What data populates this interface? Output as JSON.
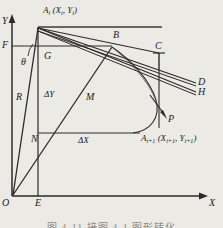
{
  "figure": {
    "type": "geometry-diagram",
    "background_color": "#eceae5",
    "ink_color": "#1a1a1a",
    "axes": {
      "y_label": "Y",
      "x_label": "X",
      "origin_label": "O"
    },
    "points": {
      "A_i": "A",
      "A_i_sub": "i",
      "A_i_coords_open": " (X",
      "A_i_coords_sub1": "i",
      "A_i_coords_mid": ", Y",
      "A_i_coords_sub2": "i",
      "A_i_coords_close": ")",
      "A_next": "A",
      "A_next_sub": "i+1",
      "A_next_coords_open": " (X",
      "A_next_coords_sub1": "i+1",
      "A_next_coords_mid": ", Y",
      "A_next_coords_sub2": "i+1",
      "A_next_coords_close": ")",
      "B": "B",
      "C": "C",
      "D": "D",
      "H": "H",
      "P": "P",
      "E": "E",
      "F": "F",
      "G": "G",
      "N": "N",
      "M": "M",
      "R": "R",
      "theta": "θ",
      "delta_y": "ΔY",
      "delta_x": "ΔX"
    },
    "caption": "图 4-11   接图 4-1 图形转化"
  }
}
